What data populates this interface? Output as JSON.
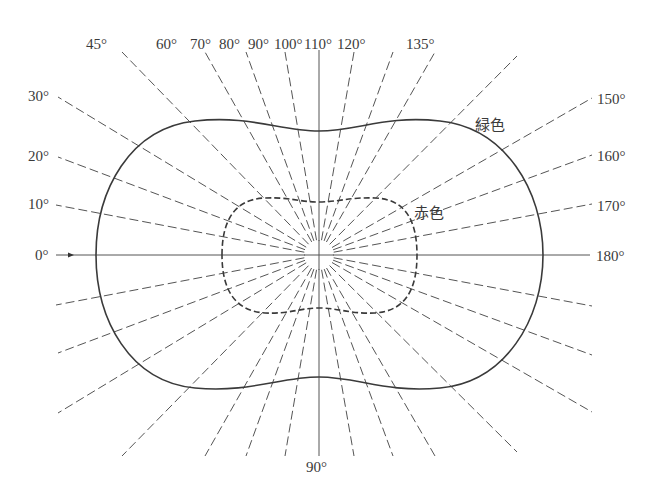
{
  "diagram": {
    "center": {
      "x": 319,
      "y": 255
    },
    "hub_radius": 15,
    "horizontal_axis": {
      "x1": 56,
      "x2": 590,
      "arrow_x": 72
    },
    "vertical_axis": {
      "y1": 50,
      "y2": 456
    },
    "rays": [
      {
        "angle": 10,
        "left_end": {
          "x": 56,
          "y": 205
        },
        "label": "10°",
        "label_pos": {
          "x": 28,
          "y": 209
        }
      },
      {
        "angle": 20,
        "left_end": {
          "x": 58,
          "y": 157
        },
        "label": "20°",
        "label_pos": {
          "x": 28,
          "y": 160
        }
      },
      {
        "angle": 30,
        "left_end": {
          "x": 58,
          "y": 97
        },
        "label": "30°",
        "label_pos": {
          "x": 28,
          "y": 100
        }
      },
      {
        "angle": 45,
        "left_end": {
          "x": 122,
          "y": 52
        },
        "label": "45°",
        "label_pos": {
          "x": 88,
          "y": 47
        }
      },
      {
        "angle": 60,
        "left_end": {
          "x": 205,
          "y": 52
        },
        "label": "60°",
        "label_pos": {
          "x": 156,
          "y": 47
        }
      },
      {
        "angle": 70,
        "left_end": {
          "x": 246,
          "y": 52
        },
        "label": "70°",
        "label_pos": {
          "x": 190,
          "y": 47
        }
      },
      {
        "angle": 80,
        "left_end": {
          "x": 285,
          "y": 52
        },
        "label": "80°",
        "label_pos": {
          "x": 220,
          "y": 47
        }
      },
      {
        "angle": 100,
        "left_end": {
          "x": 354,
          "y": 52
        },
        "label": "100°",
        "label_pos": {
          "x": 275,
          "y": 47
        }
      },
      {
        "angle": 110,
        "left_end": {
          "x": 393,
          "y": 52
        },
        "label": "110°",
        "label_pos": {
          "x": 304,
          "y": 47
        }
      },
      {
        "angle": 120,
        "left_end": {
          "x": 435,
          "y": 52
        },
        "label": "120°",
        "label_pos": {
          "x": 338,
          "y": 47
        }
      },
      {
        "angle": 135,
        "left_end": {
          "x": 517,
          "y": 56
        },
        "label": "135°",
        "label_pos": {
          "x": 407,
          "y": 47
        }
      },
      {
        "angle": 150,
        "left_end": {
          "x": 592,
          "y": 98
        },
        "label": "150°",
        "label_pos": {
          "x": 597,
          "y": 104
        }
      },
      {
        "angle": 160,
        "left_end": {
          "x": 592,
          "y": 155
        },
        "label": "160°",
        "label_pos": {
          "x": 597,
          "y": 162
        }
      },
      {
        "angle": 170,
        "left_end": {
          "x": 592,
          "y": 204
        },
        "label": "170°",
        "label_pos": {
          "x": 597,
          "y": 212
        }
      }
    ],
    "ray_endpoints_upper": [
      {
        "x": 56,
        "y": 205
      },
      {
        "x": 58,
        "y": 157
      },
      {
        "x": 58,
        "y": 97
      },
      {
        "x": 122,
        "y": 52
      },
      {
        "x": 205,
        "y": 52
      },
      {
        "x": 246,
        "y": 52
      },
      {
        "x": 285,
        "y": 52
      },
      {
        "x": 354,
        "y": 52
      },
      {
        "x": 393,
        "y": 52
      },
      {
        "x": 435,
        "y": 52
      },
      {
        "x": 517,
        "y": 56
      },
      {
        "x": 592,
        "y": 98
      },
      {
        "x": 592,
        "y": 155
      },
      {
        "x": 592,
        "y": 204
      }
    ],
    "labels": {
      "deg_0": "0°",
      "deg_10": "10°",
      "deg_20": "20°",
      "deg_30": "30°",
      "deg_45": "45°",
      "deg_60": "60°",
      "deg_70": "70°",
      "deg_80": "80°",
      "deg_90_top": "90°",
      "deg_100": "100°",
      "deg_110": "110°",
      "deg_120": "120°",
      "deg_135": "135°",
      "deg_150": "150°",
      "deg_160": "160°",
      "deg_170": "170°",
      "deg_180": "180°",
      "deg_90_bottom": "90°"
    },
    "curves": {
      "green": {
        "label": "緑色",
        "style": "solid",
        "label_pos": {
          "x": 475,
          "y": 130
        }
      },
      "red": {
        "label": "赤色",
        "style": "dashed",
        "label_pos": {
          "x": 414,
          "y": 218
        }
      }
    }
  }
}
